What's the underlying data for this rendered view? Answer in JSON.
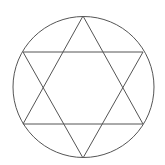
{
  "diagram": {
    "type": "hexagram-in-circle",
    "background": "#ffffff",
    "stroke_color": "#555555",
    "stroke_width": 1,
    "circle": {
      "cx": 83.5,
      "cy": 87,
      "r": 70.5
    },
    "triangle_up": {
      "points": [
        [
          83,
          16
        ],
        [
          143,
          124
        ],
        [
          23,
          124
        ]
      ]
    },
    "triangle_down": {
      "points": [
        [
          23,
          52
        ],
        [
          143,
          52
        ],
        [
          83,
          158
        ]
      ]
    }
  }
}
